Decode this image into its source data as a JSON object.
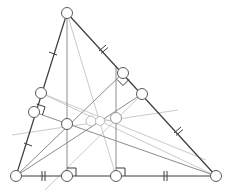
{
  "diagram": {
    "colors": {
      "background": "#ffffff",
      "triangle_side": "#404040",
      "cevian_line": "#8a8a8a",
      "light_line": "#bdbdbd",
      "point_fill": "#ffffff",
      "point_stroke": "#606060"
    },
    "vertices": {
      "A": [
        67,
        13
      ],
      "B": [
        16,
        176
      ],
      "C": [
        216,
        176
      ]
    },
    "points": [
      {
        "id": "A",
        "role": "vertex",
        "xy": [
          67,
          13
        ]
      },
      {
        "id": "B",
        "role": "vertex",
        "xy": [
          16,
          176
        ]
      },
      {
        "id": "C",
        "role": "vertex",
        "xy": [
          216,
          176
        ]
      },
      {
        "id": "D",
        "role": "foot-of-altitude-from-A",
        "xy": [
          67,
          176
        ]
      },
      {
        "id": "Mbc",
        "role": "midpoint-BC",
        "xy": [
          116,
          176
        ]
      },
      {
        "id": "Mab",
        "role": "midpoint-AB",
        "xy": [
          41,
          93
        ]
      },
      {
        "id": "F",
        "role": "foot-of-altitude-from-C",
        "xy": [
          34,
          112
        ]
      },
      {
        "id": "E",
        "role": "foot-of-altitude-from-B",
        "xy": [
          123,
          73
        ]
      },
      {
        "id": "Mac",
        "role": "midpoint-AC",
        "xy": [
          142,
          94
        ]
      },
      {
        "id": "H",
        "role": "orthocenter",
        "xy": [
          67,
          124
        ]
      },
      {
        "id": "N",
        "role": "nine-point-center",
        "xy": [
          91,
          121
        ]
      },
      {
        "id": "G",
        "role": "centroid",
        "xy": [
          100,
          121
        ]
      },
      {
        "id": "O",
        "role": "circumcenter",
        "xy": [
          116,
          118
        ]
      }
    ],
    "tick_marks": [
      {
        "segment": "AB-upper",
        "count": 1
      },
      {
        "segment": "AB-lower",
        "count": 1
      },
      {
        "segment": "AC-upper",
        "count": 2
      },
      {
        "segment": "AC-lower",
        "count": 2
      },
      {
        "segment": "BC-left",
        "count": 2
      },
      {
        "segment": "BC-right",
        "count": 2
      }
    ],
    "right_angle_markers": [
      "F",
      "E",
      "D",
      "Mbc"
    ]
  }
}
